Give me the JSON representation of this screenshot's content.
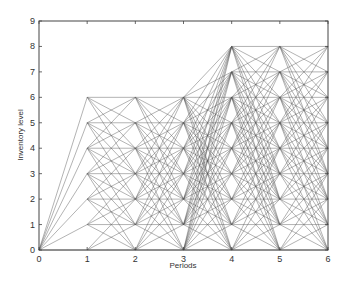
{
  "chart_data": {
    "type": "line",
    "title": "",
    "xlabel": "Periods",
    "ylabel": "Inventory level",
    "xlim": [
      0,
      6
    ],
    "ylim": [
      0,
      9
    ],
    "xticks": [
      0,
      1,
      2,
      3,
      4,
      5,
      6
    ],
    "yticks": [
      0,
      1,
      2,
      3,
      4,
      5,
      6,
      7,
      8,
      9
    ],
    "grid": false,
    "legend": null,
    "line_color": "#555555",
    "nodes": {
      "0": [
        0
      ],
      "1": [
        0,
        1,
        2,
        3,
        4,
        5,
        6
      ],
      "2": [
        0,
        1,
        2,
        3,
        4,
        5,
        6
      ],
      "3": [
        0,
        1,
        2,
        3,
        4,
        5,
        6
      ],
      "4": [
        0,
        1,
        2,
        3,
        4,
        5,
        6,
        7,
        8
      ],
      "5": [
        0,
        1,
        2,
        3,
        4,
        5,
        6,
        7,
        8
      ],
      "6": [
        0,
        1,
        2,
        3,
        4,
        5,
        6,
        7,
        8
      ]
    },
    "transitions": [
      {
        "from": 0,
        "to": 1,
        "max_down": 0,
        "max_up": 6
      },
      {
        "from": 1,
        "to": 2,
        "max_down": 3,
        "max_up": 2
      },
      {
        "from": 2,
        "to": 3,
        "max_down": 4,
        "max_up": 4
      },
      {
        "from": 3,
        "to": 4,
        "max_down": 6,
        "max_up": 8
      },
      {
        "from": 4,
        "to": 5,
        "max_down": 6,
        "max_up": 4
      },
      {
        "from": 5,
        "to": 6,
        "max_down": 5,
        "max_up": 3
      }
    ]
  }
}
